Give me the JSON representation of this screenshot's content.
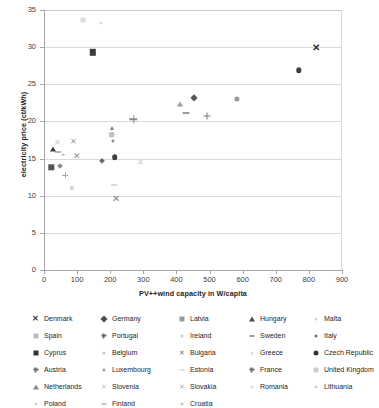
{
  "chart_data": {
    "type": "scatter",
    "title": "",
    "xlabel": "PV++wind capacity in W/capita",
    "ylabel": "electricity price (ct/kWh)",
    "xlim": [
      0,
      900
    ],
    "ylim": [
      0,
      35
    ],
    "xticks": [
      0,
      100,
      200,
      300,
      400,
      500,
      600,
      700,
      800,
      900
    ],
    "yticks": [
      0,
      5,
      10,
      15,
      20,
      25,
      30,
      35
    ],
    "grid": "horizontal",
    "legend_position": "below",
    "series": [
      {
        "name": "Denmark",
        "marker": "x-bold",
        "color": "#404040",
        "x": 30,
        "y": 17.3
      },
      {
        "name": "Germany",
        "marker": "diamond",
        "color": "#595959",
        "x": 480,
        "y": 23.1
      },
      {
        "name": "Latvia",
        "marker": "square",
        "color": "#8c8c8c",
        "x": 195,
        "y": 18.2
      },
      {
        "name": "Hungary",
        "marker": "triangle",
        "color": "#7f7f7f",
        "x": 420,
        "y": 22.3
      },
      {
        "name": "Malta",
        "marker": "dot",
        "color": "#d9d9d9",
        "x": 65,
        "y": 16.1
      },
      {
        "name": "Spain",
        "marker": "square",
        "color": "#bfbfbf",
        "x": 195,
        "y": 33.6
      },
      {
        "name": "Portugal",
        "marker": "plus",
        "color": "#7f7f7f",
        "x": 290,
        "y": 20.3
      },
      {
        "name": "Ireland",
        "marker": "dot",
        "color": "#bfbfbf",
        "x": 55,
        "y": 14.1
      },
      {
        "name": "Sweden",
        "marker": "dash",
        "color": "#404040",
        "x": 430,
        "y": 21.1
      },
      {
        "name": "Italy",
        "marker": "dot",
        "color": "#808080",
        "x": 255,
        "y": 17.4
      },
      {
        "name": "Cyprus",
        "marker": "square",
        "color": "#404040",
        "x": 145,
        "y": 29.3
      },
      {
        "name": "Belgium",
        "marker": "dot",
        "color": "#d0d0d0",
        "x": 160,
        "y": 19.6
      },
      {
        "name": "Bulgaria",
        "marker": "x-thin",
        "color": "#808080",
        "x": 215,
        "y": 9.6
      },
      {
        "name": "Greece",
        "marker": "dot",
        "color": "#e0e0e0",
        "x": 100,
        "y": 17.8
      },
      {
        "name": "Czech Republic",
        "marker": "circle",
        "color": "#404040",
        "x": 770,
        "y": 26.9
      },
      {
        "name": "Austria",
        "marker": "plus",
        "color": "#a6a6a6",
        "x": 65,
        "y": 12.8
      },
      {
        "name": "Luxembourg",
        "marker": "dot",
        "color": "#8c8c8c",
        "x": 30,
        "y": 16.5
      },
      {
        "name": "Estonia",
        "marker": "dash",
        "color": "#bfbfbf",
        "x": 215,
        "y": 11.4
      },
      {
        "name": "France",
        "marker": "plus",
        "color": "#7f7f7f",
        "x": 490,
        "y": 20.8
      },
      {
        "name": "United Kingdom",
        "marker": "square",
        "color": "#d0d0d0",
        "x": 40,
        "y": 18.4
      },
      {
        "name": "Netherlands",
        "marker": "triangle",
        "color": "#404040",
        "x": 28,
        "y": 16.3
      },
      {
        "name": "Slovenia",
        "marker": "x-thin",
        "color": "#bfbfbf",
        "x": 290,
        "y": 14.4
      },
      {
        "name": "Slovakia",
        "marker": "x-thin",
        "color": "#a6a6a6",
        "x": 80,
        "y": 15.4
      },
      {
        "name": "Romania",
        "marker": "dot",
        "color": "#d9d9d9",
        "x": 85,
        "y": 11.0
      },
      {
        "name": "Lithuania",
        "marker": "dot",
        "color": "#cccccc",
        "x": 130,
        "y": 14.2
      },
      {
        "name": "Poland",
        "marker": "dot",
        "color": "#d9d9d9",
        "x": 48,
        "y": 14.0
      },
      {
        "name": "Finland",
        "marker": "dash",
        "color": "#6e6e6e",
        "x": 40,
        "y": 16.1
      },
      {
        "name": "Croatia",
        "marker": "dot",
        "color": "#cfcfcf",
        "x": 175,
        "y": 14.6
      }
    ],
    "points": [
      {
        "label": "Denmark",
        "marker": "x-bold",
        "color": "#333333",
        "size": 8,
        "x": 822,
        "y": 29.9
      },
      {
        "label": "Czech Republic",
        "marker": "circle",
        "color": "#3f3f3f",
        "size": 5.4,
        "x": 770,
        "y": 26.9
      },
      {
        "label": "Cyprus",
        "marker": "square",
        "color": "#3a3a3a",
        "size": 6.4,
        "x": 147,
        "y": 29.3
      },
      {
        "label": "Germany",
        "marker": "diamond",
        "color": "#555555",
        "size": 5.2,
        "x": 452,
        "y": 23.1
      },
      {
        "label": "Hungary",
        "marker": "triangle",
        "color": "#9a9a9a",
        "size": 5.0,
        "x": 410,
        "y": 22.3
      },
      {
        "label": "Italy-right",
        "marker": "dot",
        "color": "#9a9a9a",
        "size": 5.2,
        "x": 582,
        "y": 23.0
      },
      {
        "label": "Sweden",
        "marker": "dash",
        "color": "#3f3f3f",
        "size": 7,
        "x": 428,
        "y": 21.1
      },
      {
        "label": "France",
        "marker": "plus",
        "color": "#777777",
        "size": 7,
        "x": 492,
        "y": 20.75
      },
      {
        "label": "Portugal",
        "marker": "plus",
        "color": "#8a8a8a",
        "size": 7.5,
        "x": 270,
        "y": 20.3
      },
      {
        "label": "Spain-mid",
        "marker": "triangle",
        "color": "#7d7d7d",
        "size": 4.6,
        "x": 205,
        "y": 19.1
      },
      {
        "label": "Latvia",
        "marker": "square",
        "color": "#c0c0c0",
        "size": 5.6,
        "x": 205,
        "y": 18.2
      },
      {
        "label": "UnitedKingdom",
        "marker": "square",
        "color": "#dcdcdc",
        "size": 5.0,
        "x": 118,
        "y": 33.6
      },
      {
        "label": "Greece",
        "marker": "x-thin",
        "color": "#9a9a9a",
        "size": 6,
        "x": 88,
        "y": 17.25
      },
      {
        "label": "Malta",
        "marker": "x-thin",
        "color": "#c9c9c9",
        "size": 6,
        "x": 40,
        "y": 17.1
      },
      {
        "label": "Italy",
        "marker": "dot",
        "color": "#8f8f8f",
        "size": 3.0,
        "x": 208,
        "y": 17.4
      },
      {
        "label": "Netherlands",
        "marker": "triangle",
        "color": "#3a3a3a",
        "size": 5.0,
        "x": 28,
        "y": 16.3
      },
      {
        "label": "Finland",
        "marker": "dash",
        "color": "#6d6d6d",
        "size": 6,
        "x": 42,
        "y": 15.9
      },
      {
        "label": "Luxembourg",
        "marker": "dot",
        "color": "#bdbdbd",
        "size": 2.6,
        "x": 58,
        "y": 15.5
      },
      {
        "label": "Slovakia",
        "marker": "x-thin",
        "color": "#8f8f8f",
        "size": 7,
        "x": 100,
        "y": 15.4
      },
      {
        "label": "Belgium",
        "marker": "circle",
        "color": "#3f3f3f",
        "size": 5.6,
        "x": 213,
        "y": 15.2
      },
      {
        "label": "Croatia",
        "marker": "diamond",
        "color": "#6a6a6a",
        "size": 4.2,
        "x": 175,
        "y": 14.65
      },
      {
        "label": "Slovenia",
        "marker": "x-thin",
        "color": "#cacaca",
        "size": 6,
        "x": 290,
        "y": 14.4
      },
      {
        "label": "Poland",
        "marker": "square",
        "color": "#555555",
        "size": 5.4,
        "x": 22,
        "y": 13.85
      },
      {
        "label": "Lithuania",
        "marker": "diamond",
        "color": "#8b8b8b",
        "size": 4.0,
        "x": 48,
        "y": 14.0
      },
      {
        "label": "Austria",
        "marker": "plus",
        "color": "#a8a8a8",
        "size": 6,
        "x": 64,
        "y": 12.75
      },
      {
        "label": "Romania",
        "marker": "dot",
        "color": "#cfcfcf",
        "size": 4.2,
        "x": 84,
        "y": 11.0
      },
      {
        "label": "Estonia",
        "marker": "dash",
        "color": "#b2b2b2",
        "size": 6,
        "x": 212,
        "y": 11.4
      },
      {
        "label": "Bulgaria",
        "marker": "x-thin",
        "color": "#8a8a8a",
        "size": 8,
        "x": 218,
        "y": 9.6
      },
      {
        "label": "Ireland",
        "marker": "dot",
        "color": "#dadada",
        "size": 3.0,
        "x": 172,
        "y": 33.3
      }
    ]
  },
  "axes": {
    "y_title": "electricity price (ct/kWh)",
    "x_title": "PV++wind capacity in W/capita",
    "y_labels": [
      "0",
      "5",
      "10",
      "15",
      "20",
      "25",
      "30",
      "35"
    ],
    "x_labels": [
      "0",
      "100",
      "200",
      "300",
      "400",
      "500",
      "600",
      "700",
      "800",
      "900"
    ]
  },
  "legend": {
    "columns": 5,
    "entries": [
      {
        "label": "Denmark",
        "marker": "x-bold",
        "color": "#3a3a3a"
      },
      {
        "label": "Germany",
        "marker": "diamond",
        "color": "#4a4a4a"
      },
      {
        "label": "Latvia",
        "marker": "square",
        "color": "#9a9a9a"
      },
      {
        "label": "Hungary",
        "marker": "triangle",
        "color": "#4a4a4a"
      },
      {
        "label": "Malta",
        "marker": "dot",
        "color": "#d6d6d6"
      },
      {
        "label": "Spain",
        "marker": "square",
        "color": "#bcbcbc"
      },
      {
        "label": "Portugal",
        "marker": "plus",
        "color": "#6f6f6f"
      },
      {
        "label": "Ireland",
        "marker": "dot",
        "color": "#d0d0d0"
      },
      {
        "label": "Sweden",
        "marker": "dash",
        "color": "#3a3a3a"
      },
      {
        "label": "Italy",
        "marker": "dot",
        "color": "#707070"
      },
      {
        "label": "Cyprus",
        "marker": "square",
        "color": "#333333"
      },
      {
        "label": "Belgium",
        "marker": "dot",
        "color": "#c6c6c6"
      },
      {
        "label": "Bulgaria",
        "marker": "x-thin",
        "color": "#7a7a7a"
      },
      {
        "label": "Greece",
        "marker": "dot",
        "color": "#dcdcdc"
      },
      {
        "label": "Czech Republic",
        "marker": "circle",
        "color": "#333333"
      },
      {
        "label": "Austria",
        "marker": "plus",
        "color": "#6f6f6f"
      },
      {
        "label": "Luxembourg",
        "marker": "dot",
        "color": "#9a9a9a"
      },
      {
        "label": "Estonia",
        "marker": "dash",
        "color": "#c6c6c6"
      },
      {
        "label": "France",
        "marker": "plus",
        "color": "#6f6f6f"
      },
      {
        "label": "United Kingdom",
        "marker": "square",
        "color": "#cfcfcf"
      },
      {
        "label": "Netherlands",
        "marker": "triangle",
        "color": "#8a8a8a"
      },
      {
        "label": "Slovenia",
        "marker": "x-thin",
        "color": "#c2c2c2"
      },
      {
        "label": "Slovakia",
        "marker": "x-thin",
        "color": "#b2b2b2"
      },
      {
        "label": "Romania",
        "marker": "dot",
        "color": "#dcdcdc"
      },
      {
        "label": "Lithuania",
        "marker": "dot",
        "color": "#cfcfcf"
      },
      {
        "label": "Poland",
        "marker": "dot",
        "color": "#d6d6d6"
      },
      {
        "label": "Finland",
        "marker": "dash",
        "color": "#8a8a8a"
      },
      {
        "label": "Croatia",
        "marker": "dot",
        "color": "#c6c6c6"
      }
    ]
  }
}
